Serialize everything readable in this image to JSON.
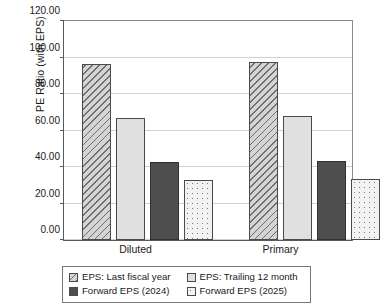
{
  "chart_data": {
    "type": "bar",
    "title": "",
    "xlabel": "",
    "ylabel": "PE Ratio (with EPS)",
    "categories": [
      "Diluted",
      "Primary"
    ],
    "ylim": [
      0,
      120
    ],
    "yticks": [
      "0.00",
      "20.00",
      "40.00",
      "60.00",
      "80.00",
      "100.00",
      "120.00"
    ],
    "ytick_values": [
      0,
      20,
      40,
      60,
      80,
      100,
      120
    ],
    "grid": true,
    "legend_position": "bottom",
    "series": [
      {
        "name": "EPS: Last fiscal year",
        "pattern": "diagonal-hatch",
        "color": "#d4d4d4",
        "values": [
          96.3,
          97.8
        ]
      },
      {
        "name": "EPS: Trailing 12 month",
        "pattern": "solid-light",
        "color": "#e0e0e0",
        "values": [
          67.0,
          68.2
        ]
      },
      {
        "name": "Forward EPS (2024)",
        "pattern": "solid-dark",
        "color": "#4e4e4e",
        "values": [
          42.5,
          43.4
        ]
      },
      {
        "name": "Forward EPS (2025)",
        "pattern": "dotted",
        "color": "#f2f2f2",
        "values": [
          33.0,
          33.7
        ]
      }
    ]
  }
}
